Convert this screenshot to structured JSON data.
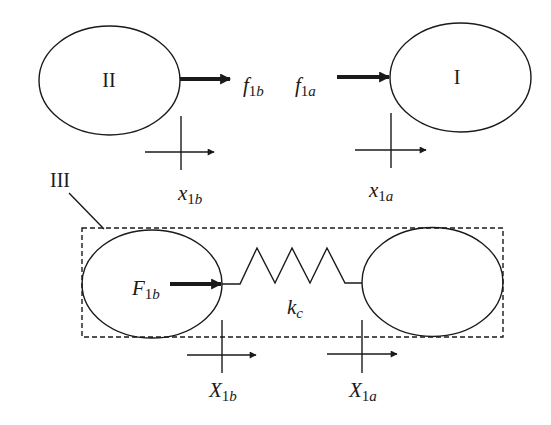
{
  "diagram": {
    "bodies": {
      "body_II": {
        "label": "II"
      },
      "body_I": {
        "label": "I"
      },
      "subsystem_III": {
        "label": "III"
      }
    },
    "forces": {
      "f1b": {
        "base": "f",
        "sub_num": "1",
        "sub_var": "b"
      },
      "f1a": {
        "base": "f",
        "sub_num": "1",
        "sub_var": "a"
      },
      "F1b": {
        "base": "F",
        "sub_num": "1",
        "sub_var": "b"
      }
    },
    "displacements": {
      "x1b": {
        "base": "x",
        "sub_num": "1",
        "sub_var": "b"
      },
      "x1a": {
        "base": "x",
        "sub_num": "1",
        "sub_var": "a"
      },
      "X1b": {
        "base": "X",
        "sub_num": "1",
        "sub_var": "b"
      },
      "X1a": {
        "base": "X",
        "sub_num": "1",
        "sub_var": "a"
      }
    },
    "spring": {
      "base": "k",
      "sub_var": "c"
    },
    "colors": {
      "stroke": "#1a1a1a",
      "background": "#ffffff"
    }
  }
}
